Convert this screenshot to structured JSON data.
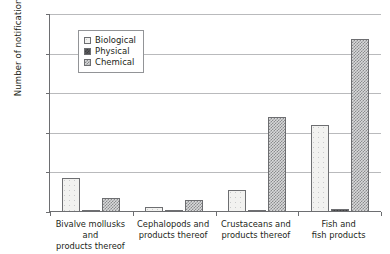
{
  "chart_data": {
    "type": "bar",
    "title": "",
    "xlabel": "",
    "ylabel": "Number of notifications",
    "ylim": [
      0,
      2500
    ],
    "yticks": [
      0,
      500,
      1000,
      1500,
      2000,
      2500
    ],
    "ytick_labels": [
      "0",
      "500",
      "1000",
      "1500",
      "2000",
      "2500"
    ],
    "grid": true,
    "legend_position": "upper-left-inside",
    "categories": [
      "Bivalve mollusks and products thereof",
      "Cephalopods and products thereof",
      "Crustaceans and products thereof",
      "Fish and fish products"
    ],
    "category_lines": [
      [
        "Bivalve mollusks and",
        "products thereof"
      ],
      [
        "Cephalopods and",
        "products thereof"
      ],
      [
        "Crustaceans and",
        "products thereof"
      ],
      [
        "Fish and",
        "fish products"
      ]
    ],
    "series": [
      {
        "name": "Biological",
        "pattern": "open-dotted",
        "values": [
          430,
          60,
          280,
          1100
        ]
      },
      {
        "name": "Physical",
        "pattern": "solid-dark",
        "values": [
          30,
          15,
          25,
          40
        ]
      },
      {
        "name": "Chemical",
        "pattern": "checkered-gray",
        "values": [
          180,
          150,
          1200,
          2180
        ]
      }
    ]
  },
  "legend": {
    "items": [
      {
        "label": "Biological"
      },
      {
        "label": "Physical"
      },
      {
        "label": "Chemical"
      }
    ]
  },
  "colors": {
    "axis": "#6d6e71",
    "gridline": "#b9babc",
    "text": "#231f20",
    "biological": "#f2f2f0",
    "physical": "#5b5c5e",
    "chemical": "#d8d9da"
  }
}
